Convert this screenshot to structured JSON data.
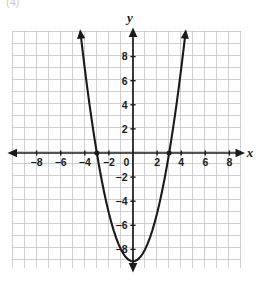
{
  "figure": {
    "corner_label": "(4)",
    "axis_x_label": "x",
    "axis_y_label": "y"
  },
  "colors": {
    "grid": "#b9bcc2",
    "grid_minor": "#c8cbd0",
    "axis": "#1a1a1a",
    "curve": "#1a1a1a",
    "label": "#1a1a1a",
    "background": "#ffffff",
    "cropmark": "#c9c9c9"
  },
  "chart_data": {
    "type": "line",
    "title": "",
    "subtitle": "",
    "xlabel": "x",
    "ylabel": "y",
    "xlim": [
      -10,
      9
    ],
    "ylim": [
      -10.5,
      10
    ],
    "grid": true,
    "grid_step": 1,
    "legend": "none",
    "x_ticks": [
      -8,
      -6,
      -4,
      -2,
      0,
      2,
      4,
      6,
      8
    ],
    "x_tick_labels": [
      "−8",
      "−6",
      "−4",
      "−2",
      "0",
      "2",
      "4",
      "6",
      "8"
    ],
    "y_ticks": [
      8,
      6,
      4,
      2,
      -2,
      -4,
      -6,
      -8
    ],
    "y_tick_labels": [
      "8",
      "6",
      "4",
      "2",
      "−2",
      "−4",
      "−6",
      "−8"
    ],
    "series": [
      {
        "name": "parabola",
        "equation": "y = x^2 - 9",
        "vertex": [
          0,
          -9
        ],
        "x_intercepts": [
          -3,
          3
        ],
        "y_intercept": -9,
        "arrowheads": [
          "start",
          "end"
        ],
        "x": [
          -4.36,
          -4.2,
          -4.0,
          -3.8,
          -3.6,
          -3.4,
          -3.2,
          -3.0,
          -2.8,
          -2.6,
          -2.4,
          -2.2,
          -2.0,
          -1.8,
          -1.6,
          -1.4,
          -1.2,
          -1.0,
          -0.8,
          -0.6,
          -0.4,
          -0.2,
          0.0,
          0.2,
          0.4,
          0.6,
          0.8,
          1.0,
          1.2,
          1.4,
          1.6,
          1.8,
          2.0,
          2.2,
          2.4,
          2.6,
          2.8,
          3.0,
          3.2,
          3.4,
          3.6,
          3.8,
          4.0,
          4.2,
          4.36
        ],
        "y": [
          10.0,
          8.64,
          7.0,
          5.44,
          3.96,
          2.56,
          1.24,
          0.0,
          -1.16,
          -2.24,
          -3.24,
          -4.16,
          -5.0,
          -5.76,
          -6.44,
          -7.04,
          -7.56,
          -8.0,
          -8.36,
          -8.64,
          -8.84,
          -8.96,
          -9.0,
          -8.96,
          -8.84,
          -8.64,
          -8.36,
          -8.0,
          -7.56,
          -7.04,
          -6.44,
          -5.76,
          -5.0,
          -4.16,
          -3.24,
          -2.24,
          -1.16,
          0.0,
          1.24,
          2.56,
          3.96,
          5.44,
          7.0,
          8.64,
          10.0
        ]
      }
    ],
    "marked_points": [
      {
        "x": -3,
        "y": 0,
        "label": ""
      },
      {
        "x": 3,
        "y": 0,
        "label": ""
      }
    ]
  }
}
